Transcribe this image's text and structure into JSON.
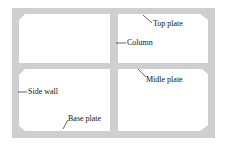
{
  "diagram": {
    "type": "cross-section",
    "colors": {
      "frame": "#cfcfcf",
      "cell": "#ffffff",
      "text": "#111111"
    },
    "labels": [
      {
        "id": "top-plate",
        "text": "Top plate"
      },
      {
        "id": "column",
        "text": "Column"
      },
      {
        "id": "side-wall",
        "text": "Side wall"
      },
      {
        "id": "midle-plate",
        "text": "Midle plate"
      },
      {
        "id": "base-plate",
        "text": "Base plate"
      }
    ]
  }
}
